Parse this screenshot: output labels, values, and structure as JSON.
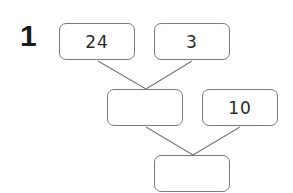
{
  "question": {
    "number": "1"
  },
  "boxes": {
    "top_left": {
      "value": "24"
    },
    "top_right": {
      "value": "3"
    },
    "middle_left": {
      "value": ""
    },
    "middle_right": {
      "value": "10"
    },
    "bottom": {
      "value": ""
    }
  },
  "colors": {
    "border": "#7a7a7a",
    "line": "#7a7a7a",
    "text": "#2a2a2a"
  }
}
